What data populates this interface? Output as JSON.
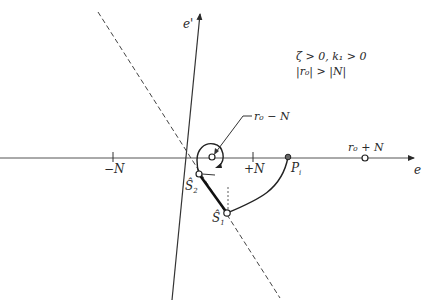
{
  "diagram": {
    "axes": {
      "horizontal_label": "e",
      "vertical_label": "e'"
    },
    "ticks": {
      "minus_n": "−N",
      "plus_n": "+N"
    },
    "conditions": {
      "line1": "ζ > 0, k₁ > 0",
      "line2": "|r₀| > |N|"
    },
    "points": {
      "r0_minus_n": "r₀ − N",
      "r0_plus_n": "r₀ + N",
      "p_i": "P",
      "p_i_sub": "i",
      "s1_hat": "Ŝ",
      "s1_sub": "1",
      "s2_hat": "Ŝ",
      "s2_sub": "2"
    },
    "colors": {
      "stroke": "#2a2a2a",
      "background": "#ffffff"
    }
  }
}
